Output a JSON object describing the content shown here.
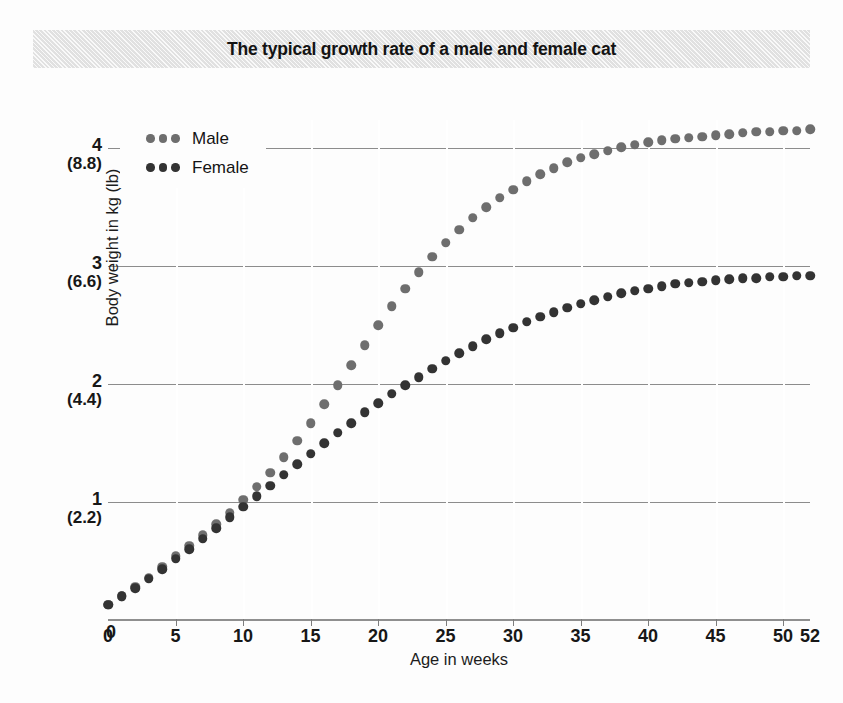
{
  "title": "The typical growth rate of a male and female cat",
  "colors": {
    "male_dot": "#6e6e6e",
    "female_dot": "#333333",
    "gridline": "#8c8c8c",
    "title_band": "#e9e9e9",
    "background": "#fdfdfd"
  },
  "legend": {
    "position": "top-left-inside",
    "entries": [
      {
        "label": "Male",
        "marker": "three-dots",
        "color": "#6e6e6e"
      },
      {
        "label": "Female",
        "marker": "three-dots",
        "color": "#333333"
      }
    ]
  },
  "axes": {
    "y_title": "Body weight in kg (lb)",
    "x_title": "Age in weeks",
    "y_ticks": [
      {
        "kg": "0",
        "lb": ""
      },
      {
        "kg": "1",
        "lb": "(2.2)"
      },
      {
        "kg": "2",
        "lb": "(4.4)"
      },
      {
        "kg": "3",
        "lb": "(6.6)"
      },
      {
        "kg": "4",
        "lb": "(8.8)"
      }
    ],
    "x_ticks": [
      "0",
      "5",
      "10",
      "15",
      "20",
      "25",
      "30",
      "35",
      "40",
      "45",
      "50",
      "52"
    ]
  },
  "chart_data": {
    "type": "scatter",
    "title": "The typical growth rate of a male and female cat",
    "xlabel": "Age in weeks",
    "ylabel": "Body weight in kg (lb)",
    "xlim": [
      0,
      52
    ],
    "ylim": [
      0,
      4.24
    ],
    "grid": true,
    "grid_axis": "both",
    "y_tick_values": [
      0,
      1,
      2,
      3,
      4
    ],
    "y_tick_labels_kg": [
      "0",
      "1",
      "2",
      "3",
      "4"
    ],
    "y_tick_labels_lb": [
      "",
      "(2.2)",
      "(4.4)",
      "(6.6)",
      "(8.8)"
    ],
    "x_tick_values": [
      0,
      5,
      10,
      15,
      20,
      25,
      30,
      35,
      40,
      45,
      50,
      52
    ],
    "legend_position": "upper left",
    "x": [
      0,
      1,
      2,
      3,
      4,
      5,
      6,
      7,
      8,
      9,
      10,
      11,
      12,
      13,
      14,
      15,
      16,
      17,
      18,
      19,
      20,
      21,
      22,
      23,
      24,
      25,
      26,
      27,
      28,
      29,
      30,
      31,
      32,
      33,
      34,
      35,
      36,
      37,
      38,
      39,
      40,
      41,
      42,
      43,
      44,
      45,
      46,
      47,
      48,
      49,
      50,
      51,
      52
    ],
    "series": [
      {
        "name": "Male",
        "color": "#6e6e6e",
        "marker": "circle",
        "values": [
          0.13,
          0.2,
          0.28,
          0.36,
          0.45,
          0.54,
          0.63,
          0.72,
          0.81,
          0.91,
          1.02,
          1.13,
          1.25,
          1.38,
          1.52,
          1.67,
          1.83,
          1.99,
          2.16,
          2.33,
          2.5,
          2.66,
          2.81,
          2.95,
          3.08,
          3.2,
          3.31,
          3.41,
          3.5,
          3.58,
          3.65,
          3.72,
          3.78,
          3.83,
          3.88,
          3.92,
          3.95,
          3.98,
          4.01,
          4.03,
          4.05,
          4.07,
          4.08,
          4.09,
          4.1,
          4.11,
          4.12,
          4.13,
          4.14,
          4.14,
          4.15,
          4.15,
          4.16
        ]
      },
      {
        "name": "Female",
        "color": "#333333",
        "marker": "circle",
        "values": [
          0.13,
          0.2,
          0.27,
          0.35,
          0.43,
          0.52,
          0.6,
          0.69,
          0.78,
          0.87,
          0.96,
          1.05,
          1.14,
          1.23,
          1.32,
          1.41,
          1.5,
          1.59,
          1.67,
          1.76,
          1.84,
          1.92,
          1.99,
          2.06,
          2.13,
          2.2,
          2.26,
          2.32,
          2.38,
          2.43,
          2.48,
          2.53,
          2.57,
          2.61,
          2.65,
          2.68,
          2.71,
          2.74,
          2.77,
          2.79,
          2.81,
          2.83,
          2.85,
          2.86,
          2.87,
          2.88,
          2.89,
          2.9,
          2.9,
          2.91,
          2.91,
          2.92,
          2.92
        ]
      }
    ],
    "annotations": [
      "Both curves overlap until about week 10, then the male curve rises faster.",
      "Male plateaus at roughly 4.15 kg; female plateaus at roughly 2.9 kg."
    ]
  }
}
